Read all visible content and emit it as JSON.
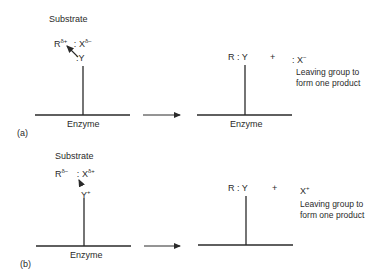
{
  "panel_a": {
    "label": "(a)",
    "substrate_label": "Substrate",
    "R": "R",
    "R_charge": "δ+",
    "sep": ":",
    "X": "X",
    "X_charge": "δ−",
    "nucleophile": ":Y",
    "enzyme_left": "Enzyme",
    "enzyme_right": "Enzyme",
    "product": "R : Y",
    "plus": "+",
    "leaving": ": X",
    "leaving_charge": "−",
    "note_line1": "Leaving group to",
    "note_line2": "form one product"
  },
  "panel_b": {
    "label": "(b)",
    "substrate_label": "Substrate",
    "R": "R",
    "R_charge": "δ−",
    "sep": ":",
    "X": "X",
    "X_charge": "δ+",
    "nucleophile": "Y",
    "nucleophile_charge": "+",
    "enzyme_left": "Enzyme",
    "product": "R : Y",
    "plus": "+",
    "leaving": "X",
    "leaving_charge": "+",
    "note_line1": "Leaving group to",
    "note_line2": "form one product"
  }
}
